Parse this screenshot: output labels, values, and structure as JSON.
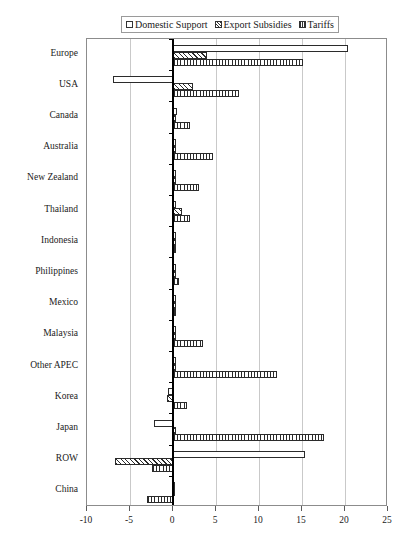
{
  "legend": {
    "position": "top-center",
    "entries": [
      {
        "label": "Domestic Support",
        "pattern": "solid-white",
        "swatch": "legend-swatch-domestic-support"
      },
      {
        "label": "Export Subsidies",
        "pattern": "diagonal-hatch",
        "swatch": "legend-swatch-export-subsidies"
      },
      {
        "label": "Tariffs",
        "pattern": "vertical-hatch",
        "swatch": "legend-swatch-tariffs"
      }
    ]
  },
  "chart_data": {
    "type": "bar",
    "orientation": "horizontal",
    "title": "",
    "subtitle": "",
    "xlabel": "",
    "ylabel": "",
    "xlim": [
      -10,
      25
    ],
    "ylim": null,
    "grid": true,
    "xticks": [
      -10,
      -5,
      0,
      5,
      10,
      15,
      20,
      25
    ],
    "xticklabels": [
      "-10",
      "-5",
      "0",
      "5",
      "10",
      "15",
      "20",
      "25"
    ],
    "categories": [
      "Europe",
      "USA",
      "Canada",
      "Australia",
      "New Zealand",
      "Thailand",
      "Indonesia",
      "Philippines",
      "Mexico",
      "Malaysia",
      "Other APEC",
      "Korea",
      "Japan",
      "ROW",
      "China"
    ],
    "series": [
      {
        "name": "Domestic Support",
        "pattern": "solid-white",
        "values": [
          20.3,
          -7.0,
          0.5,
          0.2,
          0.4,
          0.3,
          0.1,
          0.2,
          0.1,
          0.2,
          0.2,
          -0.6,
          -2.2,
          15.3,
          -0.1
        ]
      },
      {
        "name": "Export Subsidies",
        "pattern": "diagonal-hatch",
        "values": [
          3.9,
          2.3,
          0.1,
          0.1,
          0.1,
          1.0,
          0.1,
          0.4,
          0.1,
          0.1,
          0.3,
          -0.7,
          0.2,
          -6.8,
          -0.1
        ]
      },
      {
        "name": "Tariffs",
        "pattern": "vertical-hatch",
        "values": [
          15.1,
          7.7,
          2.0,
          4.7,
          3.0,
          2.0,
          0.2,
          0.7,
          0.2,
          3.5,
          12.1,
          1.6,
          17.5,
          -2.5,
          -3.0
        ]
      }
    ]
  }
}
